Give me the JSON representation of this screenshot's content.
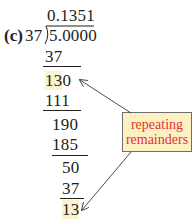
{
  "problem": {
    "label": "(c)",
    "quotient": "0.1351",
    "divisor": "37",
    "dividend": "5.0000"
  },
  "steps": [
    {
      "value": "37",
      "underline": true
    },
    {
      "value": "130",
      "highlight": "13",
      "rest": "0",
      "underline": false
    },
    {
      "value": "111",
      "underline": true
    },
    {
      "value": "190",
      "underline": false
    },
    {
      "value": "185",
      "underline": true
    },
    {
      "value": "50",
      "underline": false
    },
    {
      "value": "37",
      "underline": true
    },
    {
      "value": "13",
      "highlight": "13",
      "underline": false
    }
  ],
  "callout": {
    "line1": "repeating",
    "line2": "remainders"
  },
  "colors": {
    "text": "#231f20",
    "highlight": "#fbf2cf",
    "callout_bg": "#fdf1c4",
    "callout_text": "#e0332f",
    "arrow": "#4d4d4f"
  }
}
